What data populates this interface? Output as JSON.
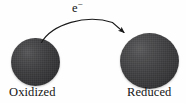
{
  "diagram": {
    "background_color": "#fefefe",
    "sphere_color": "#3a3a3c",
    "text_color": "#141414",
    "arrow_color": "#1a1a1a",
    "left_species": {
      "label": "Oxidized",
      "icon": "dark-sphere",
      "diameter_px": 49
    },
    "right_species": {
      "label": "Reduced",
      "icon": "dark-sphere",
      "diameter_px": 59
    },
    "transfer": {
      "particle": "e",
      "charge": "−",
      "direction": "left-to-right",
      "arrow_style": "curved-arc-with-filled-head"
    }
  }
}
